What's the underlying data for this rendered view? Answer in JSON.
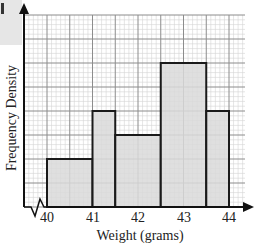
{
  "chart_data": {
    "type": "bar",
    "subtype": "histogram",
    "title": "",
    "xlabel": "Weight (grams)",
    "ylabel": "Frequency Density",
    "x_ticks": [
      "40",
      "41",
      "42",
      "43",
      "44"
    ],
    "x_range": [
      40,
      44
    ],
    "y_axis_numbers_shown": false,
    "y_units_in_major_gridlines": [
      0,
      8
    ],
    "grid": true,
    "axis_break_on_x": true,
    "bins": [
      {
        "from": 40.0,
        "to": 41.0,
        "height_gridlines": 2
      },
      {
        "from": 41.0,
        "to": 41.5,
        "height_gridlines": 4
      },
      {
        "from": 41.5,
        "to": 42.5,
        "height_gridlines": 3
      },
      {
        "from": 42.5,
        "to": 43.5,
        "height_gridlines": 6
      },
      {
        "from": 43.5,
        "to": 44.0,
        "height_gridlines": 4
      }
    ],
    "categories": [
      "40-41",
      "41-41.5",
      "41.5-42.5",
      "42.5-43.5",
      "43.5-44"
    ],
    "values": [
      2,
      4,
      3,
      6,
      4
    ]
  },
  "labels": {
    "xlabel": "Weight (grams)",
    "ylabel": "Frequency Density",
    "ticks": [
      "40",
      "41",
      "42",
      "43",
      "44"
    ]
  },
  "colors": {
    "bar_fill": "#d9d9d9",
    "bar_stroke": "#1a1a1a",
    "grid_major": "#8c8c8c",
    "grid_minor": "#d4d4d4",
    "axis": "#111111"
  }
}
